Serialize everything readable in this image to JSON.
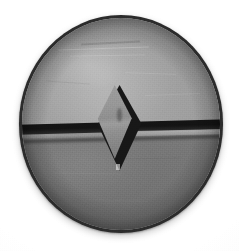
{
  "image": {
    "subject": "circular metal fastener head",
    "description": "Grayscale close-up photograph of a round metal disc, likely a screw or rivet head, photographed straight on against a plain white background.",
    "capture_style": "monochrome photograph",
    "background_color": "#ffffff",
    "canvas": {
      "width": 239,
      "height": 251
    }
  },
  "object": {
    "name": "disc",
    "shape": "circle",
    "center": {
      "x": 121,
      "y": 124
    },
    "diameter_px": 204,
    "rim": {
      "name": "outer-rim",
      "color": "#2b2b2b",
      "description": "dark irregular cast edge outlining the whole disc"
    },
    "upper_face": {
      "name": "upper-half",
      "color": "#9e9e9e",
      "tone": "light gray, lit from upper left, slightly mottled and scratched"
    },
    "lower_face": {
      "name": "lower-half",
      "color": "#737373",
      "tone": "darker uniform gray, in shadow below the slot"
    },
    "slot": {
      "name": "horizontal-slot",
      "color": "#141414",
      "orientation": "horizontal",
      "tilt_degrees": -1.5,
      "description": "dark recessed groove running the full width of the disc, slightly lower on the left side, with a pale reflective wall just beneath it"
    },
    "center_mark": {
      "name": "center-diamond",
      "shape": "diamond",
      "outline_color": "#171717",
      "face_color": "#949494",
      "top_point": {
        "x": 118,
        "y": 84
      },
      "bottom_point": {
        "x": 116,
        "y": 172
      },
      "left_point": {
        "x": 97,
        "y": 129
      },
      "right_point": {
        "x": 142,
        "y": 129
      },
      "description": "raised four-sided diamond stamped at the center, interrupting the slot"
    }
  },
  "palette": {
    "background": "#ffffff",
    "rim_dark": "#2b2b2b",
    "upper_gray": "#9e9e9e",
    "lower_gray": "#737373",
    "slot_black": "#141414",
    "diamond_face": "#949494",
    "highlight": "#b4b4b4"
  }
}
